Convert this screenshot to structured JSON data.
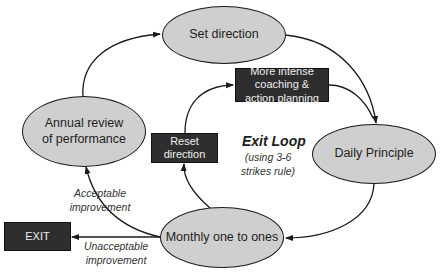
{
  "diagram": {
    "nodes": {
      "set_direction": "Set direction",
      "daily_principle": "Daily Principle",
      "monthly": "Monthly one to ones",
      "annual_review": "Annual review of performance",
      "more_intense": "More intense coaching & action planning",
      "reset_direction": "Reset direction",
      "exit": "EXIT"
    },
    "labels": {
      "exit_loop_title": "Exit Loop",
      "exit_loop_sub": "(using 3-6 strikes rule)",
      "acceptable": "Acceptable improvement",
      "unacceptable": "Unacceptable improvement"
    },
    "colors": {
      "ellipse_fill": "#cfcfcf",
      "box_fill": "#2e2e2e",
      "line": "#1a1a1a"
    }
  }
}
